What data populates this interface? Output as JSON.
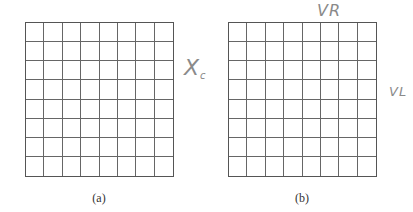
{
  "figure": {
    "top_cut_fragments": [
      "~",
      "~",
      "ﾞ"
    ],
    "panels": [
      {
        "id": "a",
        "caption": "(a)",
        "rows": 8,
        "cols": 8,
        "annotation": {
          "main": "X",
          "sub": "c"
        }
      },
      {
        "id": "b",
        "caption": "(b)",
        "rows": 8,
        "cols": 8,
        "annotation_top": "VR",
        "annotation_side": "VL"
      }
    ]
  },
  "colors": {
    "grid_line": "#666666",
    "handwriting": "#8a8a8a",
    "background": "#ffffff"
  }
}
